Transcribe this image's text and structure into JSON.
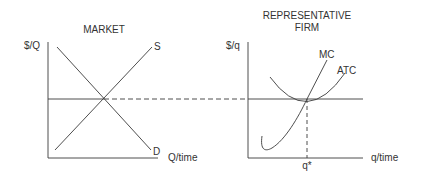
{
  "colors": {
    "line": "#3a3a3a",
    "text": "#333333",
    "background": "#ffffff"
  },
  "market": {
    "title": "MARKET",
    "y_axis_label": "$/Q",
    "x_axis_label": "Q/time",
    "supply_label": "S",
    "demand_label": "D"
  },
  "firm": {
    "title_line1": "REPRESENTATIVE",
    "title_line2": "FIRM",
    "y_axis_label": "$/q",
    "x_axis_label": "q/time",
    "mc_label": "MC",
    "atc_label": "ATC",
    "quantity_label": "q*"
  }
}
